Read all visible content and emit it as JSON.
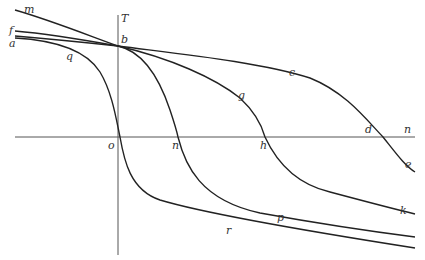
{
  "figure": {
    "type": "diagram",
    "axes": {
      "vertical_label": "T",
      "horizontal_label": "n",
      "origin_label": "o"
    },
    "point_labels": {
      "b": "b",
      "a": "a",
      "f": "f",
      "m": "m",
      "q": "q",
      "c": "c",
      "d": "d",
      "e": "e",
      "g": "g",
      "h": "h",
      "k": "k",
      "n_cross": "n",
      "p": "p",
      "r": "r"
    },
    "curves": [
      {
        "name": "m-b",
        "labels": [
          "m",
          "b"
        ]
      },
      {
        "name": "f-b",
        "labels": [
          "f",
          "b"
        ]
      },
      {
        "name": "a-q-o-r",
        "labels": [
          "a",
          "q",
          "o",
          "r"
        ]
      },
      {
        "name": "b-c-d-e",
        "labels": [
          "b",
          "c",
          "d",
          "e"
        ]
      },
      {
        "name": "b-g-h-k",
        "labels": [
          "b",
          "g",
          "h",
          "k"
        ]
      },
      {
        "name": "b-n-p",
        "labels": [
          "b",
          "n",
          "p"
        ]
      }
    ],
    "colors": {
      "line": "#222222",
      "axis": "#555555",
      "background": "#ffffff"
    }
  }
}
